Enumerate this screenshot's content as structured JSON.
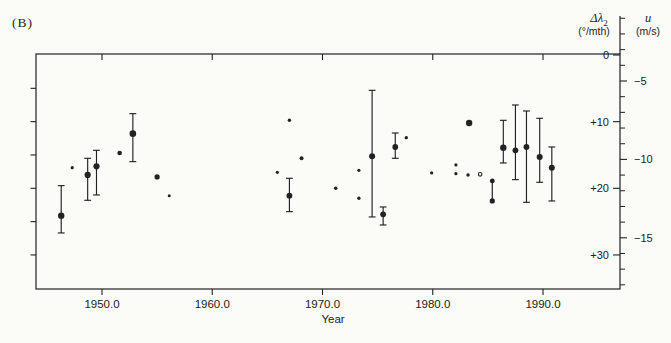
{
  "figure_label": "(B)",
  "colors": {
    "ink": "#222222",
    "background": "#fbfbf8"
  },
  "chart_data": {
    "type": "scatter",
    "title": "",
    "x_axis": {
      "label": "Year",
      "tick_values": [
        1950,
        1960,
        1970,
        1980,
        1990
      ],
      "tick_labels": [
        "1950.0",
        "1960.0",
        "1970.0",
        "1980.0",
        "1990.0"
      ],
      "range": [
        1944.0,
        1997.0
      ]
    },
    "right_axis_primary": {
      "symbol": "Δλ",
      "subscript": "2",
      "unit": "(°/mth)",
      "tick_values": [
        0,
        10,
        20,
        30
      ],
      "tick_labels": [
        "0",
        "+10",
        "+20",
        "+30"
      ],
      "range": [
        0,
        35.2
      ],
      "minor_step": 5,
      "direction": "increases-downward"
    },
    "right_axis_secondary": {
      "symbol": "u",
      "unit": "(m/s)",
      "tick_values": [
        -5,
        -10,
        -15
      ],
      "tick_labels": [
        "−5",
        "−10",
        "−15"
      ],
      "minor_tick_values": [
        -1,
        -2,
        -3,
        -4,
        -6,
        -7,
        -8,
        -9,
        -11,
        -12,
        -13,
        -14,
        -16,
        -17,
        -18
      ]
    },
    "grid": false,
    "legend": null,
    "points": [
      {
        "year": 1946.3,
        "dlambda": 24.1,
        "err": [
          19.6,
          26.7
        ],
        "r": 3.2,
        "style": "filled"
      },
      {
        "year": 1947.3,
        "dlambda": 16.9,
        "err": null,
        "r": 1.6,
        "style": "filled"
      },
      {
        "year": 1948.7,
        "dlambda": 18.0,
        "err": [
          15.5,
          21.8
        ],
        "r": 3.1,
        "style": "filled"
      },
      {
        "year": 1949.5,
        "dlambda": 16.7,
        "err": [
          14.3,
          21.0
        ],
        "r": 3.1,
        "style": "filled"
      },
      {
        "year": 1951.6,
        "dlambda": 14.7,
        "err": null,
        "r": 2.3,
        "style": "filled"
      },
      {
        "year": 1952.8,
        "dlambda": 11.8,
        "err": [
          8.8,
          16.0
        ],
        "r": 3.3,
        "style": "filled"
      },
      {
        "year": 1955.0,
        "dlambda": 18.3,
        "err": null,
        "r": 2.6,
        "style": "filled"
      },
      {
        "year": 1956.1,
        "dlambda": 21.1,
        "err": null,
        "r": 1.5,
        "style": "filled"
      },
      {
        "year": 1965.9,
        "dlambda": 17.6,
        "err": null,
        "r": 1.6,
        "style": "filled"
      },
      {
        "year": 1967.0,
        "dlambda": 9.8,
        "err": null,
        "r": 1.7,
        "style": "filled"
      },
      {
        "year": 1967.0,
        "dlambda": 21.1,
        "err": [
          18.5,
          23.5
        ],
        "r": 2.9,
        "style": "filled"
      },
      {
        "year": 1968.1,
        "dlambda": 15.5,
        "err": null,
        "r": 2.0,
        "style": "filled"
      },
      {
        "year": 1971.2,
        "dlambda": 20.0,
        "err": null,
        "r": 1.8,
        "style": "filled"
      },
      {
        "year": 1973.3,
        "dlambda": 17.3,
        "err": null,
        "r": 1.6,
        "style": "filled"
      },
      {
        "year": 1973.3,
        "dlambda": 21.5,
        "err": null,
        "r": 1.7,
        "style": "filled"
      },
      {
        "year": 1974.5,
        "dlambda": 15.2,
        "err": [
          5.3,
          24.3
        ],
        "r": 3.0,
        "style": "filled"
      },
      {
        "year": 1975.5,
        "dlambda": 23.9,
        "err": [
          22.8,
          25.5
        ],
        "r": 2.9,
        "style": "filled"
      },
      {
        "year": 1976.6,
        "dlambda": 13.8,
        "err": [
          11.7,
          15.5
        ],
        "r": 2.9,
        "style": "filled"
      },
      {
        "year": 1977.6,
        "dlambda": 12.4,
        "err": null,
        "r": 1.7,
        "style": "filled"
      },
      {
        "year": 1979.9,
        "dlambda": 17.7,
        "err": null,
        "r": 1.6,
        "style": "filled"
      },
      {
        "year": 1982.1,
        "dlambda": 16.5,
        "err": null,
        "r": 1.6,
        "style": "filled"
      },
      {
        "year": 1982.1,
        "dlambda": 17.8,
        "err": null,
        "r": 1.6,
        "style": "filled"
      },
      {
        "year": 1983.3,
        "dlambda": 10.2,
        "err": null,
        "r": 3.2,
        "style": "filled"
      },
      {
        "year": 1983.2,
        "dlambda": 18.0,
        "err": null,
        "r": 1.7,
        "style": "filled"
      },
      {
        "year": 1984.3,
        "dlambda": 17.9,
        "err": null,
        "r": 1.8,
        "style": "open"
      },
      {
        "year": 1985.4,
        "dlambda": 18.9,
        "dlambda2": 21.9,
        "err": null,
        "r": 2.4,
        "style": "pair"
      },
      {
        "year": 1986.4,
        "dlambda": 13.9,
        "err": [
          9.8,
          16.2
        ],
        "r": 3.2,
        "style": "filled"
      },
      {
        "year": 1987.5,
        "dlambda": 14.3,
        "err": [
          7.5,
          18.7
        ],
        "r": 2.9,
        "style": "filled"
      },
      {
        "year": 1988.5,
        "dlambda": 13.8,
        "err": [
          8.4,
          22.1
        ],
        "r": 2.9,
        "style": "filled"
      },
      {
        "year": 1989.7,
        "dlambda": 15.3,
        "err": [
          9.5,
          19.1
        ],
        "r": 3.0,
        "style": "filled"
      },
      {
        "year": 1990.8,
        "dlambda": 16.9,
        "err": [
          13.8,
          21.9
        ],
        "r": 3.0,
        "style": "filled"
      }
    ]
  }
}
